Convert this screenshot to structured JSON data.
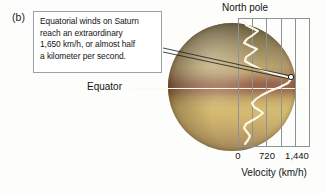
{
  "figure": {
    "panel_label": "(b)",
    "callout_text": "Equatorial winds on Saturn\nreach an extraordinary\n1,650 km/h, or almost half\na kilometer per second.",
    "north_pole_label": "North pole",
    "equator_label": "Equator",
    "axis_title": "Velocity (km/h)"
  },
  "colors": {
    "callout_border": "#9aa2a6",
    "callout_background": "#ffffff",
    "text": "#141414",
    "frame": "#8d9295",
    "curve": "#fdf8e8",
    "leader_line": "#1a1a1a",
    "equator_line": "#fdfaec",
    "planet_band_equatorial": "#96624b",
    "planet_band_south": "#d4bb73",
    "planet_band_north": "#a89a6d"
  },
  "chart_data": {
    "type": "line",
    "xlabel": "Velocity (km/h)",
    "ylabel": "Latitude",
    "xlim": [
      0,
      1800
    ],
    "grid": true,
    "legend": "none",
    "orientation": "horizontal-velocity-vs-vertical-latitude",
    "tick_labels": [
      "0",
      "720",
      "1,440"
    ],
    "tick_values": [
      0,
      720,
      1440
    ],
    "tick_x_px": [
      238,
      266,
      295
    ],
    "gridline_values": [
      0,
      360,
      720,
      1080,
      1440,
      1800
    ],
    "annotation": {
      "text": "1,650 km/h peak equatorial wind",
      "value": 1650,
      "marker_px": [
        291,
        76
      ]
    },
    "series": [
      {
        "name": "Zonal wind speed",
        "note": "velocity (x) as a function of latitude (y); y given top=north pole to bottom=south",
        "points_px": [
          [
            243,
            20
          ],
          [
            246,
            25
          ],
          [
            252,
            28
          ],
          [
            258,
            31
          ],
          [
            253,
            35
          ],
          [
            247,
            39
          ],
          [
            244,
            43
          ],
          [
            250,
            46
          ],
          [
            257,
            49
          ],
          [
            252,
            53
          ],
          [
            246,
            57
          ],
          [
            245,
            61
          ],
          [
            250,
            64
          ],
          [
            256,
            67
          ],
          [
            262,
            70
          ],
          [
            272,
            73
          ],
          [
            284,
            76
          ],
          [
            291,
            79
          ],
          [
            288,
            83
          ],
          [
            280,
            87
          ],
          [
            270,
            91
          ],
          [
            262,
            95
          ],
          [
            256,
            99
          ],
          [
            252,
            103
          ],
          [
            254,
            107
          ],
          [
            259,
            110
          ],
          [
            263,
            113
          ],
          [
            258,
            117
          ],
          [
            251,
            121
          ],
          [
            246,
            124
          ],
          [
            244,
            128
          ],
          [
            247,
            132
          ],
          [
            250,
            136
          ],
          [
            248,
            140
          ],
          [
            245,
            144
          ]
        ]
      }
    ]
  }
}
